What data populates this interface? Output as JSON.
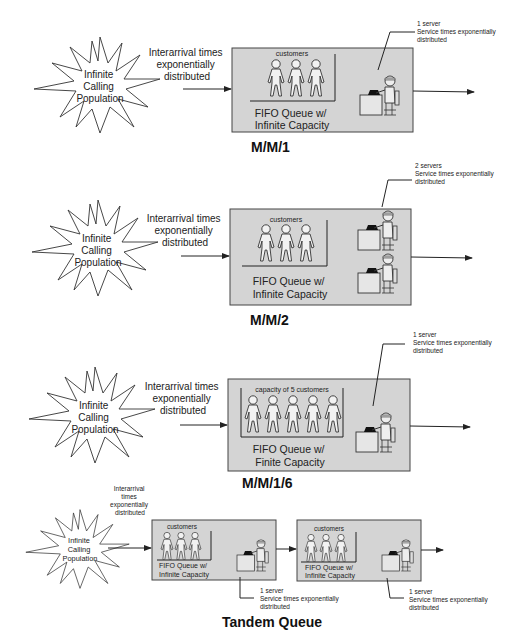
{
  "diagram": {
    "sections": [
      {
        "id": "mm1",
        "title": "M/M/1",
        "population_label": [
          "Infinite",
          "Calling",
          "Population"
        ],
        "arrival_label": [
          "Interarrival times",
          "exponentially",
          "distributed"
        ],
        "queue_header": "customers",
        "queue_label": [
          "FIFO Queue w/",
          "Infinite Capacity"
        ],
        "customer_count": 3,
        "server_note": [
          "1 server",
          "Service times exponentially",
          "distributed"
        ],
        "server_count": 1
      },
      {
        "id": "mm2",
        "title": "M/M/2",
        "population_label": [
          "Infinite",
          "Calling",
          "Population"
        ],
        "arrival_label": [
          "Interarrival times",
          "exponentially",
          "distributed"
        ],
        "queue_header": "customers",
        "queue_label": [
          "FIFO Queue w/",
          "Infinite Capacity"
        ],
        "customer_count": 3,
        "server_note": [
          "2 servers",
          "Service times exponentially",
          "distributed"
        ],
        "server_count": 2
      },
      {
        "id": "mm16",
        "title": "M/M/1/6",
        "population_label": [
          "Infinite",
          "Calling",
          "Population"
        ],
        "arrival_label": [
          "Interarrival times",
          "exponentially",
          "distributed"
        ],
        "queue_header": "capacity of  5 customers",
        "queue_label": [
          "FIFO Queue w/",
          "Finite Capacity"
        ],
        "customer_count": 5,
        "server_note": [
          "1 server",
          "Service times exponentially",
          "distributed"
        ],
        "server_count": 1
      },
      {
        "id": "tandem",
        "title": "Tandem Queue",
        "population_label": [
          "Infinite",
          "Calling",
          "Population"
        ],
        "arrival_label": [
          "Interarrival",
          "times",
          "exponentially",
          "distributed"
        ],
        "stages": [
          {
            "queue_header": "customers",
            "queue_label": [
              "FIFO Queue w/",
              "Infinite Capacity"
            ],
            "customer_count": 3,
            "server_note": [
              "1 server",
              "Service times exponentially",
              "distributed"
            ]
          },
          {
            "queue_header": "customers",
            "queue_label": [
              "FIFO Queue w/",
              "Infinite Capacity"
            ],
            "customer_count": 3,
            "server_note": [
              "1 server",
              "Service times exponentially",
              "distributed"
            ]
          }
        ]
      }
    ],
    "colors": {
      "box_fill": "#d4d4d4",
      "stroke": "#333333",
      "background": "#ffffff"
    }
  }
}
